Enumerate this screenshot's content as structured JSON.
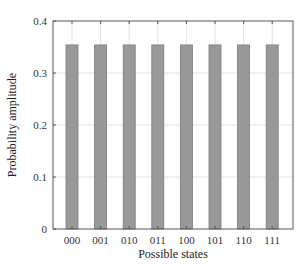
{
  "chart_data": {
    "type": "bar",
    "title": "",
    "xlabel": "Possible states",
    "ylabel": "Probability amplitude",
    "categories": [
      "000",
      "001",
      "010",
      "011",
      "100",
      "101",
      "110",
      "111"
    ],
    "values": [
      0.354,
      0.354,
      0.354,
      0.354,
      0.354,
      0.354,
      0.354,
      0.354
    ],
    "ylim": [
      0,
      0.4
    ],
    "yticks": [
      "0",
      "0.1",
      "0.2",
      "0.3",
      "0.4"
    ],
    "grid": true,
    "legend": null,
    "colors": {
      "bar": "#999999",
      "bar_edge": "#7a7a7a",
      "grid": "#e2e2e2",
      "axis": "#555555"
    }
  }
}
